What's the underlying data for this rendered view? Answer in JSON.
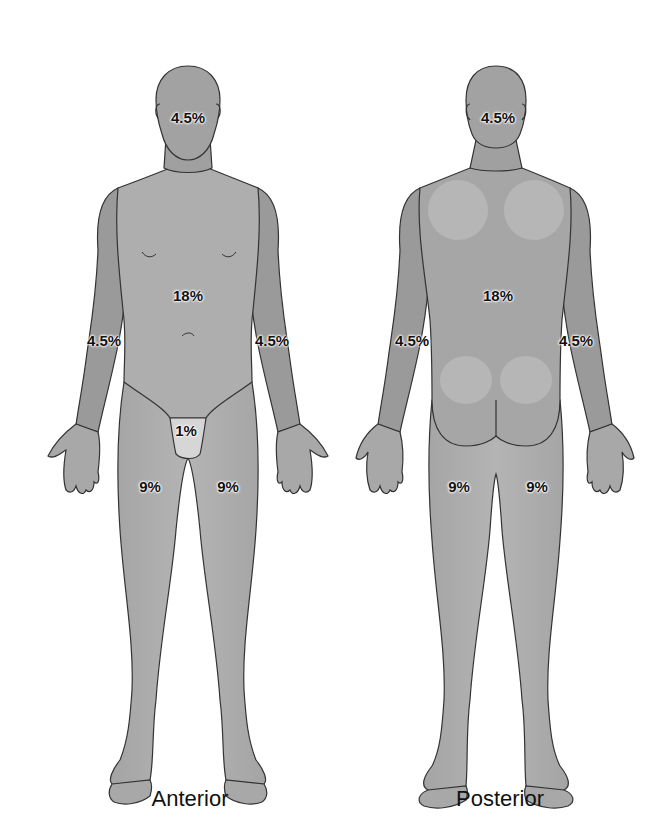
{
  "colors": {
    "skin": "#a8a8a8",
    "skin_dark": "#959595",
    "skin_light": "#c2c2c2",
    "outline": "#333333",
    "genital_region": "#d6d6d6",
    "background": "#ffffff",
    "text": "#111111"
  },
  "views": [
    {
      "id": "anterior",
      "label": "Anterior",
      "regions": [
        {
          "name": "head",
          "value": "4.5%"
        },
        {
          "name": "trunk",
          "value": "18%"
        },
        {
          "name": "right-arm",
          "value": "4.5%"
        },
        {
          "name": "left-arm",
          "value": "4.5%"
        },
        {
          "name": "genitals",
          "value": "1%"
        },
        {
          "name": "right-leg",
          "value": "9%"
        },
        {
          "name": "left-leg",
          "value": "9%"
        }
      ]
    },
    {
      "id": "posterior",
      "label": "Posterior",
      "regions": [
        {
          "name": "head",
          "value": "4.5%"
        },
        {
          "name": "trunk",
          "value": "18%"
        },
        {
          "name": "left-arm",
          "value": "4.5%"
        },
        {
          "name": "right-arm",
          "value": "4.5%"
        },
        {
          "name": "left-leg",
          "value": "9%"
        },
        {
          "name": "right-leg",
          "value": "9%"
        }
      ]
    }
  ]
}
